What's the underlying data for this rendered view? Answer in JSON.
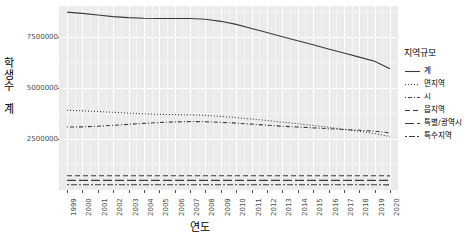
{
  "chart_data": {
    "type": "line",
    "title": "",
    "xlabel": "연도",
    "ylabel": "학생수_계",
    "grid": true,
    "legend_position": "right",
    "legend_title": "지역규모",
    "x": [
      1999,
      2000,
      2001,
      2002,
      2003,
      2004,
      2005,
      2006,
      2007,
      2008,
      2009,
      2010,
      2011,
      2012,
      2013,
      2014,
      2015,
      2016,
      2017,
      2018,
      2019,
      2020
    ],
    "xtick_labels": [
      "1999",
      "2000",
      "2001",
      "2002",
      "2003",
      "2004",
      "2005",
      "2006",
      "2007",
      "2008",
      "2009",
      "2010",
      "2011",
      "2012",
      "2013",
      "2014",
      "2015",
      "2016",
      "2017",
      "2018",
      "2019",
      "2020"
    ],
    "ytick_labels": [
      "2500000",
      "5000000",
      "7500000"
    ],
    "ytick_values": [
      2500000,
      5000000,
      7500000
    ],
    "ylim": [
      0,
      9000000
    ],
    "xlim": [
      1999,
      2020
    ],
    "series": [
      {
        "name": "계",
        "dash": "solid",
        "values": [
          8700000,
          8640000,
          8560000,
          8480000,
          8430000,
          8400000,
          8390000,
          8390000,
          8390000,
          8350000,
          8250000,
          8100000,
          7900000,
          7700000,
          7500000,
          7300000,
          7100000,
          6900000,
          6700000,
          6500000,
          6300000,
          5930000
        ]
      },
      {
        "name": "면지역",
        "dash": "dotted",
        "values": [
          3900000,
          3870000,
          3840000,
          3800000,
          3760000,
          3730000,
          3700000,
          3690000,
          3680000,
          3650000,
          3600000,
          3540000,
          3470000,
          3400000,
          3320000,
          3240000,
          3160000,
          3070000,
          2970000,
          2870000,
          2760000,
          2620000
        ]
      },
      {
        "name": "시",
        "dash": "dotdash",
        "values": [
          3080000,
          3090000,
          3120000,
          3160000,
          3210000,
          3260000,
          3300000,
          3330000,
          3350000,
          3340000,
          3310000,
          3270000,
          3220000,
          3170000,
          3120000,
          3080000,
          3040000,
          3000000,
          2960000,
          2920000,
          2880000,
          2790000
        ]
      },
      {
        "name": "읍지역",
        "dash": "dashed",
        "values": [
          700000,
          700000,
          700000,
          700000,
          700000,
          700000,
          700000,
          700000,
          700000,
          700000,
          700000,
          700000,
          700000,
          700000,
          700000,
          700000,
          700000,
          700000,
          700000,
          700000,
          700000,
          690000
        ]
      },
      {
        "name": "특별/광역시",
        "dash": "longdash",
        "values": [
          470000,
          470000,
          470000,
          470000,
          470000,
          470000,
          470000,
          470000,
          470000,
          470000,
          470000,
          470000,
          470000,
          470000,
          470000,
          470000,
          470000,
          470000,
          470000,
          470000,
          470000,
          470000
        ]
      },
      {
        "name": "특수지역",
        "dash": "twodash",
        "values": [
          260000,
          260000,
          260000,
          260000,
          260000,
          260000,
          260000,
          260000,
          260000,
          260000,
          260000,
          260000,
          260000,
          260000,
          260000,
          260000,
          260000,
          260000,
          260000,
          260000,
          260000,
          250000
        ]
      }
    ],
    "line_color": "#3a3a3a",
    "panel_color": "#ebebeb",
    "gridline_color": "#ffffff"
  }
}
